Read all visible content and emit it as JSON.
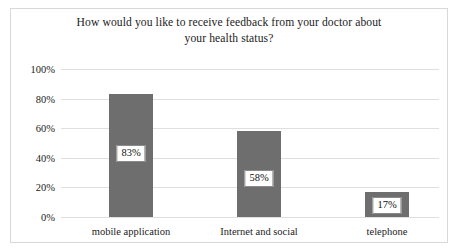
{
  "chart_data": {
    "type": "bar",
    "title": "How would you like to receive feedback from your doctor about your health status?",
    "title_lines": [
      "How would you like to receive feedback from your doctor about",
      "your health status?"
    ],
    "categories": [
      "mobile application",
      "Internet and social",
      "telephone"
    ],
    "values": [
      83,
      58,
      17
    ],
    "value_labels": [
      "83%",
      "58%",
      "17%"
    ],
    "xlabel": "",
    "ylabel": "",
    "ylim": [
      0,
      100
    ],
    "ytick_values": [
      100,
      80,
      60,
      40,
      20,
      0
    ],
    "ytick_labels": [
      "100%",
      "80%",
      "60%",
      "40%",
      "20%",
      "0%"
    ],
    "grid": true,
    "legend": false,
    "bar_color": "#6e6e6e",
    "grid_color": "#dfdfdf",
    "frame_color": "#d8d8d8",
    "label_box_border": "#8a8a8a",
    "label_box_fill": "#ffffff"
  }
}
